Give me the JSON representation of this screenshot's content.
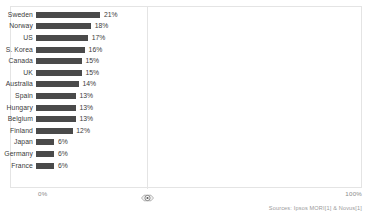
{
  "chart_data": {
    "type": "bar",
    "orientation": "horizontal",
    "title": "",
    "xlabel": "",
    "ylabel": "",
    "xlim": [
      0,
      100
    ],
    "grid": true,
    "legend": null,
    "axis_ticks": [
      "0%",
      "100%"
    ],
    "categories": [
      "Sweden",
      "Norway",
      "US",
      "S. Korea",
      "Canada",
      "UK",
      "Australia",
      "Spain",
      "Hungary",
      "Belgium",
      "Finland",
      "Japan",
      "Germany",
      "France"
    ],
    "values": [
      21,
      18,
      17,
      16,
      15,
      15,
      14,
      13,
      13,
      13,
      12,
      6,
      6,
      6
    ],
    "value_labels": [
      "21%",
      "18%",
      "17%",
      "16%",
      "15%",
      "15%",
      "14%",
      "13%",
      "13%",
      "13%",
      "12%",
      "6%",
      "6%",
      "6%"
    ],
    "bar_color": "#4a4a4a",
    "background_color": "#ffffff",
    "annotations": {
      "source": "Sources: Ipsos MORI[1] & Novus[1]"
    }
  },
  "axis": {
    "left_label": "0%",
    "right_label": "100%"
  },
  "footer": {
    "source": "Sources: Ipsos MORI[1] & Novus[1]"
  },
  "marker": {
    "icon": "circle-logo-icon"
  }
}
